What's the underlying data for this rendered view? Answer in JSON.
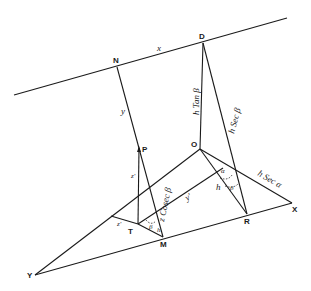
{
  "diagram": {
    "points": {
      "N": "N",
      "D": "D",
      "P": "P",
      "O": "O",
      "T": "T",
      "M": "M",
      "R": "R",
      "X": "X",
      "Y": "Y"
    },
    "labels": {
      "x": "x",
      "y": "y",
      "z_prime": "z'",
      "y_prime": "y'",
      "h_tan_beta": "h Tan β",
      "h_sec_beta": "h Sec β",
      "h_sec_alpha": "h Sec α",
      "z_cosec_beta": "z Cosec β",
      "h": "h",
      "alpha": "α",
      "beta_right": "β",
      "beta_left": "β",
      "z_near_T": "z'",
      "h_near_M": "h"
    }
  }
}
